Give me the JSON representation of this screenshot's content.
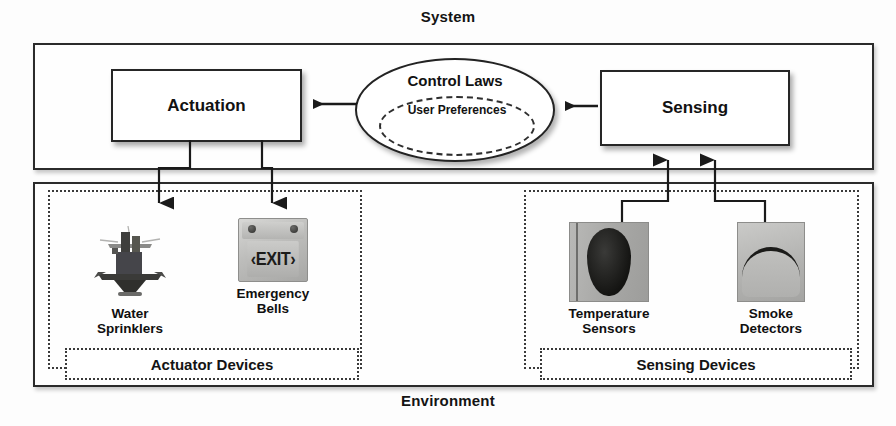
{
  "diagram": {
    "outer_top_label": "System",
    "outer_bottom_label": "Environment",
    "system_box": {
      "name": "System"
    },
    "environment_box": {
      "name": "Environment"
    },
    "blocks": {
      "actuation": "Actuation",
      "sensing": "Sensing"
    },
    "control_laws": {
      "title": "Control Laws",
      "inner_title": "User\nPreferences"
    },
    "groups": {
      "actuator": {
        "caption": "Actuator Devices",
        "devices": [
          {
            "id": "water-sprinklers",
            "caption": "Water\nSprinklers",
            "image": "water-sprinkler-photo"
          },
          {
            "id": "emergency-bells",
            "caption": "Emergency\nBells",
            "image": "exit-sign-photo",
            "sign_text": "‹EXIT›"
          }
        ]
      },
      "sensing": {
        "caption": "Sensing Devices",
        "devices": [
          {
            "id": "temperature-sensors",
            "caption": "Temperature\nSensors",
            "image": "temperature-sensor-photo"
          },
          {
            "id": "smoke-detectors",
            "caption": "Smoke\nDetectors",
            "image": "smoke-detector-photo"
          }
        ]
      }
    },
    "connectors": [
      {
        "from": "control-laws",
        "to": "actuation",
        "direction": "left",
        "style": "solid-arrow"
      },
      {
        "from": "sensing",
        "to": "control-laws",
        "direction": "left",
        "style": "solid-arrow"
      },
      {
        "from": "actuation",
        "to": "water-sprinklers",
        "direction": "down",
        "style": "solid-arrow"
      },
      {
        "from": "actuation",
        "to": "emergency-bells",
        "direction": "down",
        "style": "solid-arrow"
      },
      {
        "from": "temperature-sensors",
        "to": "sensing",
        "direction": "up",
        "style": "solid-arrow"
      },
      {
        "from": "smoke-detectors",
        "to": "sensing",
        "direction": "up",
        "style": "solid-arrow"
      }
    ],
    "colors": {
      "stroke": "#262626",
      "text": "#121212",
      "background": "#ffffff"
    }
  }
}
